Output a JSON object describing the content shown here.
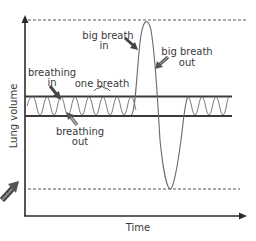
{
  "diagram": {
    "axes": {
      "y_label": "Lung volume",
      "x_label": "Time"
    },
    "labels": {
      "big_breath_in_line1": "big breath",
      "big_breath_in_line2": "in",
      "big_breath_out_line1": "big breath",
      "big_breath_out_line2": "out",
      "breathing_in_line1": "breathing",
      "breathing_in_line2": "in",
      "one_breath": "one breath",
      "breathing_out_line1": "breathing",
      "breathing_out_line2": "out"
    },
    "colors": {
      "axis": "#2b2b2b",
      "band_line": "#3a3a3a",
      "wave": "#7a7a7a",
      "dashed": "#555555",
      "arrow_dark": "#444444",
      "arrow_light": "#9a9a9a"
    }
  }
}
